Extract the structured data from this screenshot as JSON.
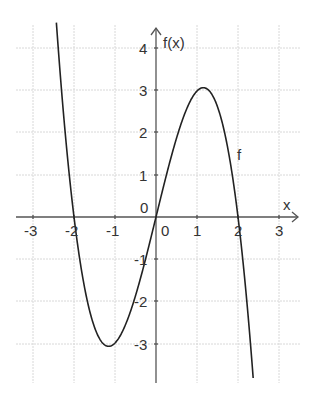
{
  "chart_data": {
    "type": "line",
    "title": "",
    "function_label": "f",
    "formula_estimate": "f(x) = -x^3 + 4x",
    "xlabel": "x",
    "ylabel": "f(x)",
    "xlim": [
      -3.3,
      3.5
    ],
    "ylim": [
      -4,
      4.6
    ],
    "x_ticks": [
      -3,
      -2,
      -1,
      0,
      1,
      2,
      3
    ],
    "y_ticks": [
      -3,
      -2,
      -1,
      1,
      2,
      3,
      4
    ],
    "x_tick_labels": [
      "-3",
      "-2",
      "-1",
      "0",
      "1",
      "2",
      "3"
    ],
    "y_tick_labels": [
      "-3",
      "-2",
      "-1",
      "1",
      "2",
      "3",
      "4"
    ],
    "origin_label": "0",
    "grid": true,
    "legend": "none",
    "key_points": {
      "zeros": [
        -2,
        0,
        2
      ],
      "local_max": {
        "x": 1.15,
        "y": 3.08
      },
      "local_min": {
        "x": -1.15,
        "y": -3.08
      }
    },
    "series": [
      {
        "name": "f",
        "x": [
          -2.45,
          -2.25,
          -2.0,
          -1.75,
          -1.5,
          -1.15,
          -1.0,
          -0.5,
          0,
          0.5,
          1.0,
          1.15,
          1.5,
          1.75,
          2.0,
          2.25,
          2.4
        ],
        "values": [
          4.91,
          2.39,
          0.0,
          -1.64,
          -2.63,
          -3.08,
          -3.0,
          -1.88,
          0.0,
          1.88,
          3.0,
          3.08,
          2.63,
          1.64,
          0.0,
          -2.39,
          -4.22
        ]
      }
    ]
  },
  "labels": {
    "x_axis": "x",
    "y_axis": "f(x)",
    "curve": "f",
    "origin": "0",
    "x_ticks": [
      "-3",
      "-2",
      "-1",
      "1",
      "2",
      "3"
    ],
    "y_ticks": [
      "4",
      "3",
      "2",
      "1",
      "-1",
      "-2",
      "-3"
    ]
  }
}
